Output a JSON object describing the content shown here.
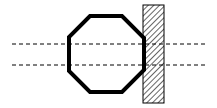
{
  "diagram": {
    "colors": {
      "stroke": "#000000",
      "background": "#ffffff"
    },
    "octagon": {
      "points": "90,16 122,16 144,38 144,70 122,92 90,92 69,71 69,37"
    },
    "wall": {
      "x": 143,
      "y": 5,
      "width": 21,
      "height": 98
    },
    "dashed_lines": [
      {
        "y": 44,
        "x1": 12,
        "x2": 207
      },
      {
        "y": 65,
        "x1": 12,
        "x2": 207
      }
    ]
  }
}
